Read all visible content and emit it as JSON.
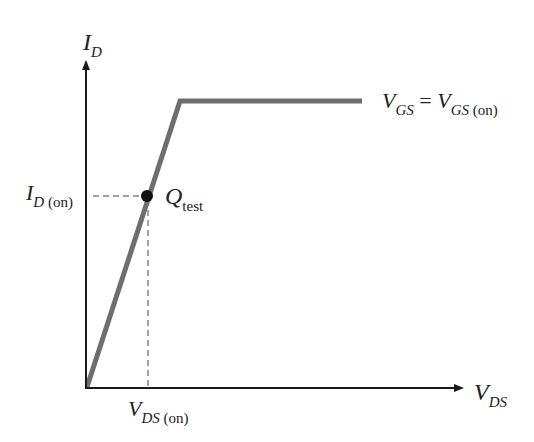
{
  "diagram": {
    "type": "MOSFET drain characteristic (ohmic region test point)",
    "y_axis": {
      "label_main": "I",
      "label_sub": "D"
    },
    "x_axis": {
      "label_main": "V",
      "label_sub": "DS"
    },
    "curve_label": {
      "left_main": "V",
      "left_sub": "GS",
      "equals": " = ",
      "right_main": "V",
      "right_sub": "GS",
      "right_sub2": " (on)"
    },
    "id_on_label": {
      "main": "I",
      "sub": "D",
      "sub2": " (on)"
    },
    "vds_on_label": {
      "main": "V",
      "sub": "DS",
      "sub2": " (on)"
    },
    "q_point_label": {
      "main": "Q",
      "sub": "test"
    },
    "colors": {
      "axis": "#1a1a1a",
      "curve": "#6e6e6e",
      "dashed": "#444444",
      "point": "#111111"
    }
  }
}
